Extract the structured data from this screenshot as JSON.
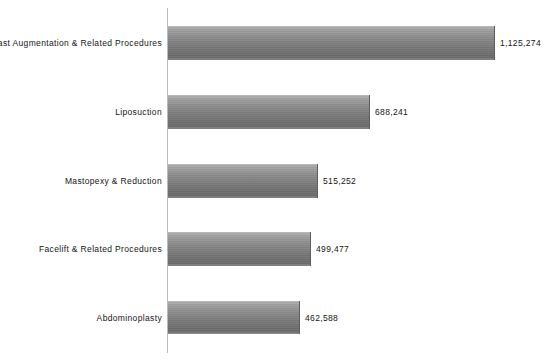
{
  "chart_data": {
    "type": "bar",
    "orientation": "horizontal",
    "title": "",
    "subtitle": "",
    "xlabel": "",
    "ylabel": "",
    "grid": false,
    "legend": false,
    "axis_line": "category-axis-vertical",
    "xlim": [
      0,
      1270000
    ],
    "categories": [
      "Breast Augmentation & Related Procedures",
      "Liposuction",
      "Mastopexy & Reduction",
      "Facelift & Related Procedures",
      "Abdominoplasty"
    ],
    "values": [
      1125274,
      688241,
      515252,
      499477,
      462588
    ],
    "value_labels": [
      "1,125,274",
      "688,241",
      "515,252",
      "499,477",
      "462,588"
    ],
    "bar_color": "#7c7c7c",
    "bar_edge_color": "#5e5e5e",
    "text_color": "#151515",
    "background_color": "#ffffff",
    "axis_color": "#b9b9b9"
  },
  "bars": [
    {
      "category": "Breast Augmentation & Related Procedures",
      "value": 1125274,
      "value_label": "1,125,274",
      "bar_width_px": 327,
      "top_px": 26,
      "height_px": 34
    },
    {
      "category": "Liposuction",
      "value": 688241,
      "value_label": "688,241",
      "bar_width_px": 202,
      "top_px": 95,
      "height_px": 34
    },
    {
      "category": "Mastopexy & Reduction",
      "value": 515252,
      "value_label": "515,252",
      "bar_width_px": 150,
      "top_px": 164,
      "height_px": 34
    },
    {
      "category": "Facelift & Related Procedures",
      "value": 499477,
      "value_label": "499,477",
      "bar_width_px": 143,
      "top_px": 232,
      "height_px": 34
    },
    {
      "category": "Abdominoplasty",
      "value": 462588,
      "value_label": "462,588",
      "bar_width_px": 132,
      "top_px": 301,
      "height_px": 33
    }
  ]
}
